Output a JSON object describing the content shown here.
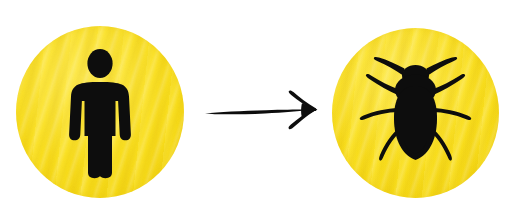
{
  "scene": {
    "title": "Human transforms into bug",
    "background_color": "#ffffff",
    "width": 521,
    "height": 218
  },
  "palette": {
    "badge_yellow": "#f9de1d",
    "badge_yellow_light": "#fde94f",
    "badge_yellow_dark": "#ecce0b",
    "ink_black": "#0d0d0d",
    "page_white": "#ffffff"
  },
  "left_badge": {
    "label": "human-figure-badge",
    "icon_name": "person-pictogram-icon",
    "shape": "circle",
    "fill_color": "#f9de1d",
    "icon_color": "#0d0d0d",
    "texture": "diagonal-wavy-stripes",
    "center_x": 100,
    "center_y": 110,
    "diameter": 168
  },
  "arrow": {
    "label": "transformation-arrow",
    "icon_name": "right-arrow-icon",
    "direction": "right",
    "style": "hand-drawn",
    "color": "#0d0d0d",
    "start_x": 207,
    "end_x": 312,
    "y": 112
  },
  "right_badge": {
    "label": "bug-figure-badge",
    "icon_name": "cockroach-icon",
    "shape": "circle",
    "fill_color": "#f9de1d",
    "icon_color": "#0d0d0d",
    "texture": "diagonal-wavy-stripes",
    "center_x": 415,
    "center_y": 111,
    "diameter": 167,
    "leg_count": 6,
    "antenna_count": 2
  },
  "caption": {
    "text": ""
  }
}
